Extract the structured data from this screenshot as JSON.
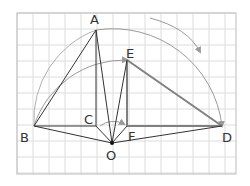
{
  "diagram": {
    "grid": {
      "x0": 17,
      "y0": 13,
      "x1": 236,
      "y1": 174,
      "step": 16,
      "color": "#dcdcdc",
      "border": "#bdbdbd"
    },
    "colors": {
      "line": "#333333",
      "thick": "#808080",
      "arc": "#9a9a9a",
      "label": "#333333"
    },
    "points": {
      "A": {
        "x": 96,
        "y": 30,
        "label": "A",
        "lx": 90,
        "ly": 22
      },
      "B": {
        "x": 34,
        "y": 126,
        "label": "B",
        "lx": 22,
        "ly": 141
      },
      "C": {
        "x": 96,
        "y": 126,
        "label": "C",
        "lx": 84,
        "ly": 124
      },
      "D": {
        "x": 222,
        "y": 126,
        "label": "D",
        "lx": 222,
        "ly": 141
      },
      "E": {
        "x": 127,
        "y": 60,
        "label": "E",
        "lx": 128,
        "ly": 58
      },
      "F": {
        "x": 127,
        "y": 126,
        "label": "F",
        "lx": 128,
        "ly": 140
      },
      "O": {
        "x": 112,
        "y": 143,
        "label": "O",
        "lx": 106,
        "ly": 159
      }
    },
    "labels": [
      "A",
      "B",
      "C",
      "D",
      "E",
      "F",
      "O"
    ]
  }
}
